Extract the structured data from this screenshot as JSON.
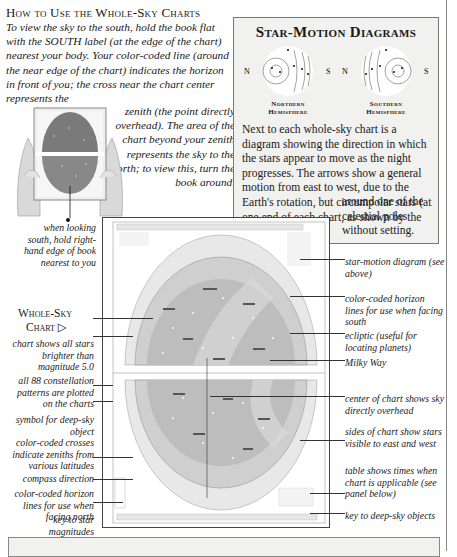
{
  "heading": "How to Use the Whole-Sky Charts",
  "intro": {
    "part1": "To view the sky to the south, hold the book flat with the SOUTH label (at the edge of the chart) nearest your body. Your color-coded line (around the near edge of the chart) indicates the horizon in front of you; the cross near the chart center represents the",
    "part2": "zenith (the point directly overhead). The area of the chart beyond your zenith represents the sky to the north; to view this, turn the book around."
  },
  "photo_caption": "when looking south, hold right-hand edge of book nearest to you",
  "star_motion": {
    "title": "Star-Motion Diagrams",
    "northern": {
      "left": "N",
      "right": "S",
      "label_line1": "Northern",
      "label_line2": "Hemisphere"
    },
    "southern": {
      "left": "N",
      "right": "S",
      "label_line1": "Southern",
      "label_line2": "Hemisphere"
    },
    "text": "Next to each whole-sky chart is a diagram showing the direction in which the stars appear to move as the night progresses. The arrows show a general motion from east to west, due to the Earth's rotation, but circumpolar stars (at one end of each chart, as shown by the diagram) rotate",
    "text_tail": "around one of the celestial poles without setting."
  },
  "whole_sky": {
    "title_line1": "Whole-Sky",
    "title_line2": "Chart",
    "arrow": "▷"
  },
  "left_callouts": [
    "chart shows all stars brighter than magnitude 5.0",
    "all 88 constellation patterns are plotted on the charts",
    "symbol for deep-sky object",
    "color-coded crosses indicate zeniths from various latitudes",
    "compass direction",
    "color-coded horizon lines for use when facing north",
    "key to star magnitudes"
  ],
  "right_callouts": [
    "star-motion diagram (see above)",
    "color-coded horizon lines for use when facing south",
    "ecliptic (useful for locating planets)",
    "Milky Way",
    "center of chart shows sky directly overhead",
    "sides of chart show stars visible to east and west",
    "table shows times when chart is applicable (see panel below)",
    "key to deep-sky objects"
  ],
  "mini_chart": {
    "side_title_line1": "Whole-Sky",
    "side_title_line2": "Chart"
  },
  "colors": {
    "panel_bg": "#f1f1ef",
    "chart_gray": "#bdbdbd",
    "chart_light": "#dcdcdc"
  }
}
